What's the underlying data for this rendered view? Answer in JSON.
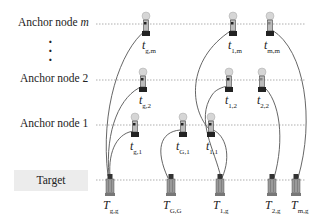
{
  "diagram": {
    "rows": [
      {
        "id": "anchor-m",
        "label": "Anchor node m",
        "label_main": "Anchor node ",
        "label_italic": "m",
        "y": 24
      },
      {
        "id": "anchor-2",
        "label": "Anchor node 2",
        "label_main": "Anchor node 2",
        "label_italic": "",
        "y": 80
      },
      {
        "id": "anchor-1",
        "label": "Anchor node 1",
        "label_main": "Anchor node 1",
        "label_italic": "",
        "y": 125
      },
      {
        "id": "target",
        "label": "Target",
        "y": 180
      }
    ],
    "ellipsis": "⋮",
    "anchor_devices": [
      {
        "id": "t_g_m",
        "label": "t",
        "sub": "g,m",
        "sub_italic_part": "m",
        "x": 146,
        "row": "anchor-m"
      },
      {
        "id": "t_1_m",
        "label": "t",
        "sub": "1,m",
        "x": 233,
        "row": "anchor-m"
      },
      {
        "id": "t_m_m",
        "label": "t",
        "sub": "m,m",
        "x": 270,
        "row": "anchor-m"
      },
      {
        "id": "t_g_2",
        "label": "t",
        "sub": "g,2",
        "x": 143,
        "row": "anchor-2"
      },
      {
        "id": "t_1_2",
        "label": "t",
        "sub": "1,2",
        "x": 229,
        "row": "anchor-2"
      },
      {
        "id": "t_2_2",
        "label": "t",
        "sub": "2,2",
        "x": 262,
        "row": "anchor-2"
      },
      {
        "id": "t_g_1",
        "label": "t",
        "sub": "g,1",
        "x": 135,
        "row": "anchor-1"
      },
      {
        "id": "t_G_1",
        "label": "t",
        "sub": "G,1",
        "x": 183,
        "row": "anchor-1"
      },
      {
        "id": "t_1_1",
        "label": "t",
        "sub": "1,1",
        "x": 211,
        "row": "anchor-1"
      }
    ],
    "target_devices": [
      {
        "id": "T_g_g",
        "label": "T",
        "sub": "g,g",
        "x": 110
      },
      {
        "id": "T_G_G",
        "label": "T",
        "sub": "G,G",
        "x": 171
      },
      {
        "id": "T_1_g",
        "label": "T",
        "sub": "1,g",
        "x": 220
      },
      {
        "id": "T_2_g",
        "label": "T",
        "sub": "2,g",
        "x": 272
      },
      {
        "id": "T_m_g",
        "label": "T",
        "sub": "m,g",
        "x": 296
      }
    ],
    "links": [
      {
        "from": "T_g_g",
        "to": "t_g_m"
      },
      {
        "from": "T_g_g",
        "to": "t_g_2"
      },
      {
        "from": "T_g_g",
        "to": "t_g_1"
      },
      {
        "from": "T_G_G",
        "to": "t_G_1"
      },
      {
        "from": "T_1_g",
        "to": "t_1_1"
      },
      {
        "from": "T_1_g",
        "to": "t_1_2"
      },
      {
        "from": "T_1_g",
        "to": "t_1_m"
      },
      {
        "from": "T_2_g",
        "to": "t_2_2"
      },
      {
        "from": "T_m_g",
        "to": "t_m_m"
      }
    ],
    "colors": {
      "line": "#555555",
      "dotted": "#9a9a9a",
      "target_box": "#ececec",
      "device_dark": "#222222",
      "device_light": "#cfcfcf"
    }
  }
}
